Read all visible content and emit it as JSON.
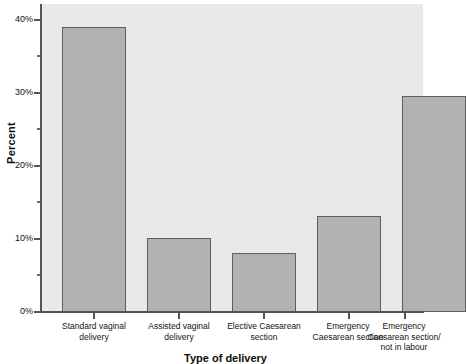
{
  "chart_data": {
    "type": "bar",
    "title": "",
    "subtitle": "",
    "xlabel": "Type of delivery",
    "ylabel": "Percent",
    "categories": [
      "Standard vaginal delivery",
      "Assisted vaginal delivery",
      "Elective Caesarean section",
      "Emergency Caesarean section",
      "Emergency Caesarean section/ not in labour"
    ],
    "category_lines": [
      [
        "Standard vaginal",
        "delivery"
      ],
      [
        "Assisted vaginal",
        "delivery"
      ],
      [
        "Elective Caesarean",
        "section"
      ],
      [
        "Emergency",
        "Caesarean section"
      ],
      [
        "Emergency",
        "Caesarean section/",
        "not in labour"
      ]
    ],
    "values": [
      39.0,
      10.2,
      8.1,
      13.2,
      29.6
    ],
    "ylim": [
      0,
      42
    ],
    "y_major_ticks": [
      0,
      10,
      20,
      30,
      40
    ],
    "y_major_tick_labels": [
      "0%",
      "10%",
      "20%",
      "30%",
      "40%"
    ],
    "y_minor_ticks": [
      5,
      15,
      25,
      35
    ],
    "grid": false,
    "legend": false,
    "legend_position": "none",
    "bar_fill_color": "#b2b2b2",
    "bar_border_color": "#5e5e5e",
    "plot_background_color": "#e9e9e9",
    "axis_color": "#555555",
    "figure_background_color": "#ffffff"
  }
}
